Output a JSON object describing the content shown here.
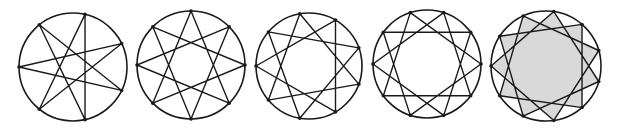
{
  "figure": {
    "stroke_color": "#1a1a1a",
    "background": "#ffffff",
    "fill_color": "#d9d9d9"
  },
  "stars": [
    {
      "label": "{7/3}",
      "n": 7,
      "k": 3,
      "cx": 73,
      "cy": 67,
      "r": 54,
      "start_angle_deg": 180,
      "filled": false
    },
    {
      "label": "{8/3}",
      "n": 8,
      "k": 3,
      "cx": 191,
      "cy": 65,
      "r": 54,
      "start_angle_deg": -90,
      "filled": false
    },
    {
      "label": "{9/3}",
      "n": 9,
      "k": 3,
      "cx": 309,
      "cy": 66,
      "r": 53,
      "start_angle_deg": 180,
      "filled": false
    },
    {
      "label": "{10/3}",
      "n": 10,
      "k": 3,
      "cx": 427,
      "cy": 64,
      "r": 54,
      "start_angle_deg": 180,
      "filled": false
    },
    {
      "label": "{11/3}",
      "n": 11,
      "k": 3,
      "cx": 546,
      "cy": 66,
      "r": 55,
      "start_angle_deg": 180,
      "filled": true
    }
  ]
}
